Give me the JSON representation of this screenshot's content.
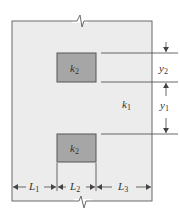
{
  "diagram": {
    "colors": {
      "outer_fill": "#ececec",
      "outer_stroke": "#6a6a6a",
      "inset_fill": "#a6a6a6",
      "inset_stroke": "#555555",
      "line": "#444444"
    },
    "region": {
      "label_base": "k",
      "label_sub": "1"
    },
    "insets": [
      {
        "label_base": "k",
        "label_sub": "2",
        "position": "upper"
      },
      {
        "label_base": "k",
        "label_sub": "2",
        "position": "lower"
      }
    ],
    "vertical_dimensions": [
      {
        "label_base": "y",
        "label_sub": "2"
      },
      {
        "label_base": "y",
        "label_sub": "1"
      }
    ],
    "horizontal_dimensions": [
      {
        "label_base": "L",
        "label_sub": "1"
      },
      {
        "label_base": "L",
        "label_sub": "2"
      },
      {
        "label_base": "L",
        "label_sub": "3"
      }
    ],
    "break_marks": [
      "top",
      "bottom"
    ]
  }
}
